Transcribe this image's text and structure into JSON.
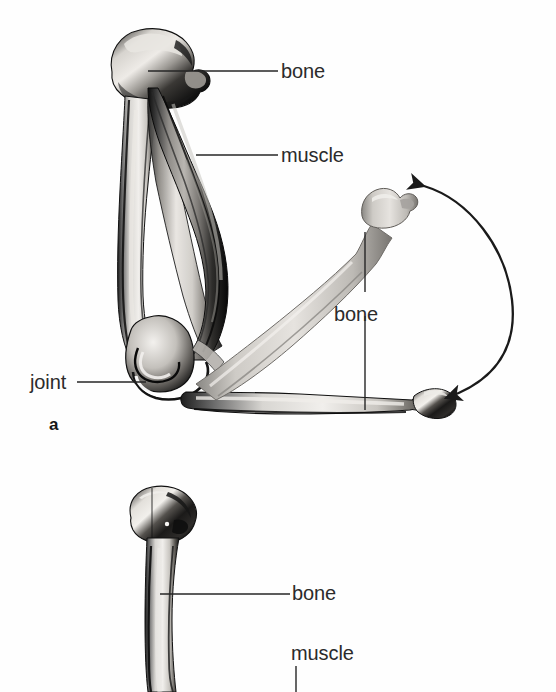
{
  "figure": {
    "background_color": "#fefefe",
    "ink_color": "#262626",
    "text_color": "#2b2b2b",
    "caption_note": "Anatomical illustration of a limb showing bone, muscle and joint, in two panels"
  },
  "panels": [
    {
      "id": "a",
      "letter": "a",
      "description": "Flexed limb with muscle contracted; lower bone shown in two positions with a double-headed curved arrow indicating range of movement",
      "labels": [
        {
          "name": "bone-upper",
          "text": "bone",
          "x": 281,
          "y": 61
        },
        {
          "name": "muscle-upper",
          "text": "muscle",
          "x": 281,
          "y": 145
        },
        {
          "name": "bone-forearm",
          "text": "bone",
          "x": 334,
          "y": 304
        },
        {
          "name": "joint",
          "text": "joint",
          "x": 30,
          "y": 372
        }
      ]
    },
    {
      "id": "b",
      "letter": "",
      "description": "Extended limb, upper portion visible; bone and muscle labelled",
      "labels": [
        {
          "name": "bone-lower-panel",
          "text": "bone",
          "x": 292,
          "y": 583
        },
        {
          "name": "muscle-lower-panel",
          "text": "muscle",
          "x": 291,
          "y": 643
        }
      ]
    }
  ],
  "annotations": {
    "movement_arrow": {
      "name": "range-of-motion-arrow",
      "style": "double-headed curved arc",
      "direction": "bidirectional"
    }
  }
}
